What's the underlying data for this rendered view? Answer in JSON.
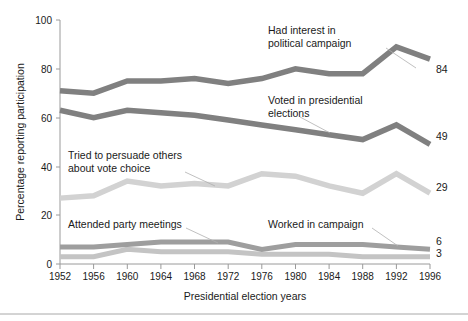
{
  "chart_data": {
    "type": "line",
    "title": "",
    "xlabel": "Presidential election years",
    "ylabel": "Percentage reporting participation",
    "categories": [
      1952,
      1956,
      1960,
      1964,
      1968,
      1972,
      1976,
      1980,
      1984,
      1988,
      1992,
      1996
    ],
    "xlim": [
      1952,
      1996
    ],
    "ylim": [
      0,
      100
    ],
    "yticks": [
      0,
      20,
      40,
      60,
      80,
      100
    ],
    "xticks": [
      "1952",
      "1956",
      "1960",
      "1964",
      "1968",
      "1972",
      "1976",
      "1980",
      "1984",
      "1988",
      "1992",
      "1996"
    ],
    "grid": false,
    "legend": "annotations-on-plot",
    "series": [
      {
        "name": "Had interest in political campaign",
        "color": "#808080",
        "values": [
          71,
          70,
          75,
          75,
          76,
          74,
          76,
          80,
          78,
          78,
          89,
          84
        ],
        "end_label": "84"
      },
      {
        "name": "Voted in presidential elections",
        "color": "#808080",
        "values": [
          63,
          60,
          63,
          62,
          61,
          59,
          57,
          55,
          53,
          51,
          57,
          49
        ],
        "end_label": "49"
      },
      {
        "name": "Tried to persuade others about vote choice",
        "color": "#d2d2d2",
        "values": [
          27,
          28,
          34,
          32,
          33,
          32,
          37,
          36,
          32,
          29,
          37,
          29
        ],
        "end_label": "29"
      },
      {
        "name": "Attended party meetings",
        "color": "#9e9e9e",
        "values": [
          7,
          7,
          8,
          9,
          9,
          9,
          6,
          8,
          8,
          8,
          7,
          6
        ],
        "end_label": "6"
      },
      {
        "name": "Worked in campaign",
        "color": "#c4c4c4",
        "values": [
          3,
          3,
          6,
          5,
          5,
          5,
          4,
          4,
          4,
          3,
          3,
          3
        ],
        "end_label": "3"
      }
    ],
    "annotations": [
      {
        "text_line1": "Had interest in",
        "text_line2": "political campaign"
      },
      {
        "text_line1": "Voted in presidential",
        "text_line2": "elections"
      },
      {
        "text_line1": "Tried to persuade others",
        "text_line2": "about vote choice"
      },
      {
        "text_line1": "Attended party meetings",
        "text_line2": ""
      },
      {
        "text_line1": "Worked in campaign",
        "text_line2": ""
      }
    ]
  }
}
